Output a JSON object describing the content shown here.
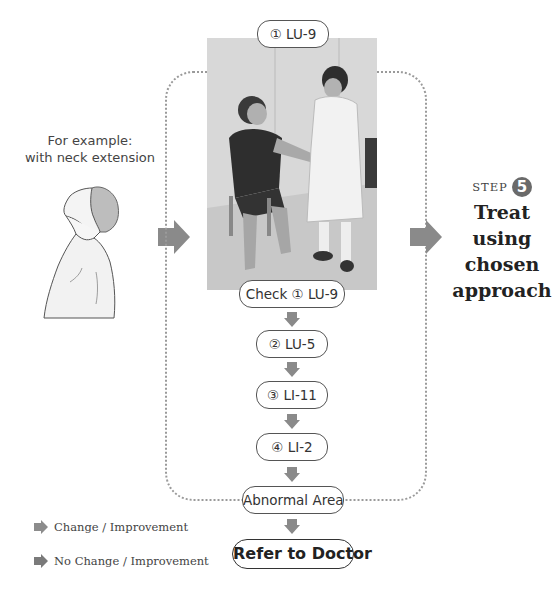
{
  "example": {
    "line1": "For example:",
    "line2": "with neck extension",
    "illustration": "neck-extension-figure"
  },
  "flow": {
    "top_point": "① LU-9",
    "photo": "practitioner-checking-LU-9-on-seated-patient",
    "steps": [
      {
        "label": "Check ① LU-9"
      },
      {
        "label": "② LU-5"
      },
      {
        "label": "③ LI-11"
      },
      {
        "label": "④ LI-2"
      },
      {
        "label": "Abnormal Area"
      }
    ],
    "final": "Refer to Doctor"
  },
  "step": {
    "prefix": "STEP",
    "number": "5",
    "title_lines": [
      "Treat",
      "using",
      "chosen",
      "approach"
    ]
  },
  "legend": {
    "items": [
      {
        "label": "Change / Improvement",
        "color": "#8c8c8c"
      },
      {
        "label": "No Change / Improvement",
        "color": "#7a7a7a"
      }
    ]
  },
  "colors": {
    "arrow": "#8a8a8a",
    "dotted_border": "#9a9a9a",
    "step_circle": "#6a6a6a"
  }
}
